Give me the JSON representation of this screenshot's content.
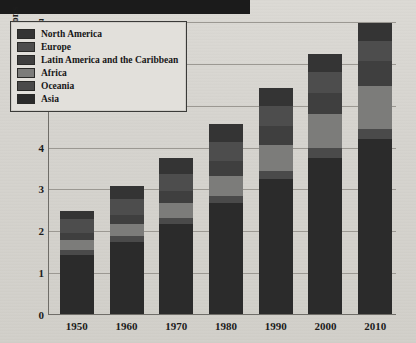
{
  "page": {
    "top_band": "black-header-band"
  },
  "chart_data": {
    "type": "bar",
    "stacked": true,
    "title": "",
    "xlabel": "",
    "ylabel": "Population in billions",
    "ylim": [
      0,
      7
    ],
    "yticks": [
      0,
      1,
      2,
      3,
      4,
      5,
      6,
      7
    ],
    "grid": true,
    "legend_position": "top-left",
    "categories": [
      "1950",
      "1960",
      "1970",
      "1980",
      "1990",
      "2000",
      "2010"
    ],
    "series": [
      {
        "name": "Asia",
        "color": "#2b2b2b",
        "values": [
          1.4,
          1.73,
          2.14,
          2.65,
          3.22,
          3.73,
          4.17
        ]
      },
      {
        "name": "Oceania",
        "color": "#4a4a4a",
        "values": [
          0.13,
          0.14,
          0.15,
          0.17,
          0.2,
          0.23,
          0.25
        ]
      },
      {
        "name": "Africa",
        "color": "#7c7c7a",
        "values": [
          0.23,
          0.28,
          0.36,
          0.48,
          0.63,
          0.81,
          1.03
        ]
      },
      {
        "name": "Latin America and the Caribbean",
        "color": "#3f3f3f",
        "values": [
          0.17,
          0.22,
          0.29,
          0.36,
          0.44,
          0.52,
          0.59
        ]
      },
      {
        "name": "Europe",
        "color": "#4d4d4d",
        "values": [
          0.35,
          0.38,
          0.41,
          0.45,
          0.48,
          0.49,
          0.49
        ]
      },
      {
        "name": "North America",
        "color": "#343434",
        "values": [
          0.17,
          0.3,
          0.38,
          0.42,
          0.42,
          0.43,
          0.43
        ]
      }
    ],
    "totals": [
      2.45,
      3.05,
      3.73,
      4.53,
      5.39,
      6.21,
      6.96
    ]
  },
  "legend": {
    "items": [
      {
        "label": "North America",
        "color": "#343434"
      },
      {
        "label": "Europe",
        "color": "#4d4d4d"
      },
      {
        "label": "Latin America and the Caribbean",
        "color": "#3f3f3f"
      },
      {
        "label": "Africa",
        "color": "#7c7c7a"
      },
      {
        "label": "Oceania",
        "color": "#4a4a4a"
      },
      {
        "label": "Asia",
        "color": "#2b2b2b"
      }
    ]
  }
}
